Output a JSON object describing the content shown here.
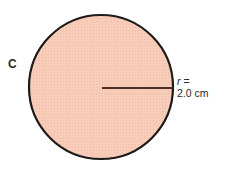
{
  "figure": {
    "label": "C",
    "radius_variable": "r",
    "radius_equals": " =",
    "radius_value": "2.0 cm",
    "colors": {
      "fill": "#f7cdb9",
      "outline": "#1e1a1a",
      "radius_line": "#4a2e28"
    }
  }
}
